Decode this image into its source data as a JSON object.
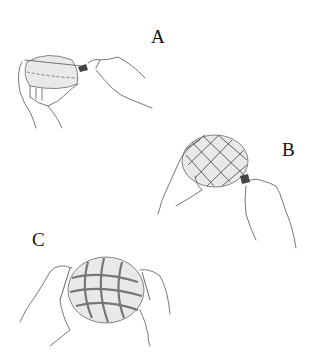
{
  "figure": {
    "panels": [
      {
        "id": "A",
        "label": "A",
        "description": "Hands holding a sphere while a tool scores a line around its circumference (dashed guide line)"
      },
      {
        "id": "B",
        "label": "B",
        "description": "Hand holding sphere covered with a diamond net pattern while tool is applied at the edge"
      },
      {
        "id": "C",
        "label": "C",
        "description": "Two hands holding sphere with completed woven lattice net"
      }
    ]
  },
  "colors": {
    "line": "#555555",
    "shade": "#e9e9e9",
    "tool_tip": "#444444",
    "background": "#ffffff"
  }
}
